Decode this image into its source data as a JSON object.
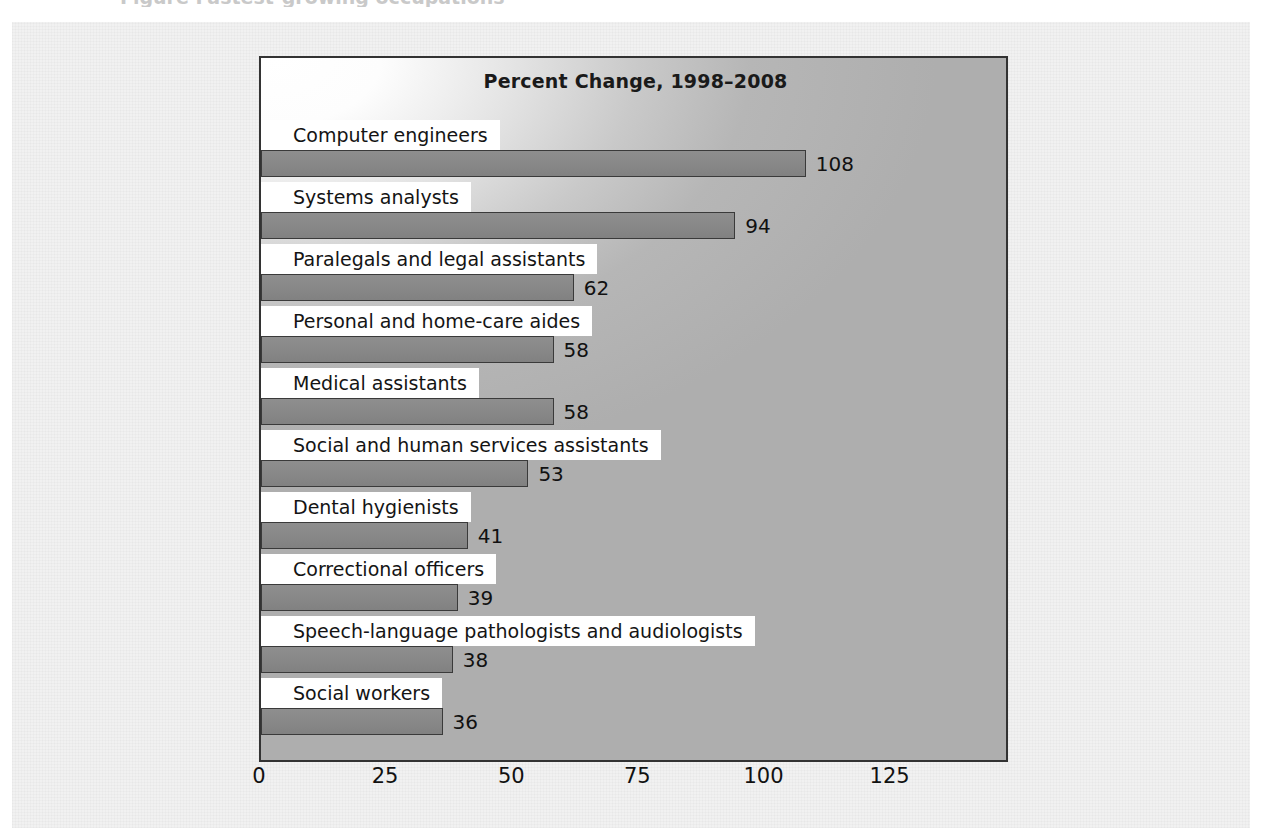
{
  "figure": {
    "caption_sliver": "Figure  Fastest-growing occupations"
  },
  "chart_data": {
    "type": "bar",
    "orientation": "horizontal",
    "title": "Percent Change, 1998–2008",
    "xlabel": "",
    "ylabel": "",
    "xlim": [
      0,
      148
    ],
    "xticks": [
      0,
      25,
      50,
      75,
      100,
      125
    ],
    "xtick_labels": [
      "0",
      "25",
      "50",
      "75",
      "100",
      "125"
    ],
    "grid": false,
    "legend": null,
    "categories": [
      "Computer engineers",
      "Systems analysts",
      "Paralegals and legal assistants",
      "Personal and home-care aides",
      "Medical assistants",
      "Social and human services assistants",
      "Dental hygienists",
      "Correctional officers",
      "Speech-language pathologists and audiologists",
      "Social workers"
    ],
    "values": [
      108,
      94,
      62,
      58,
      58,
      53,
      41,
      39,
      38,
      36
    ],
    "value_labels": [
      "108",
      "94",
      "62",
      "58",
      "58",
      "53",
      "41",
      "39",
      "38",
      "36"
    ]
  },
  "colors": {
    "bar_fill": "#888888",
    "bar_edge": "#3a3a3a",
    "plot_border": "#333333",
    "label_background": "#ffffff",
    "text": "#111111",
    "page_background": "#f1f1f1"
  }
}
